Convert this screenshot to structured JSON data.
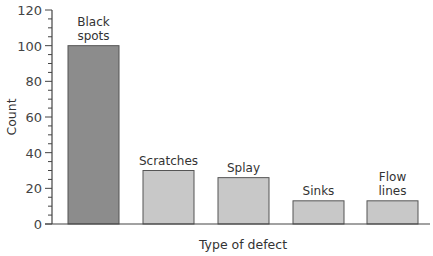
{
  "chart_data": {
    "type": "bar",
    "title": "",
    "xlabel": "Type of defect",
    "ylabel": "Count",
    "ylim": [
      0,
      120
    ],
    "yticks": [
      0,
      20,
      40,
      60,
      80,
      100,
      120
    ],
    "minor_tick_step": 5,
    "grid": false,
    "legend": null,
    "categories": [
      "Black spots",
      "Scratches",
      "Splay",
      "Sinks",
      "Flow lines"
    ],
    "category_label_lines": [
      [
        "Black",
        "spots"
      ],
      [
        "Scratches"
      ],
      [
        "Splay"
      ],
      [
        "Sinks"
      ],
      [
        "Flow",
        "lines"
      ]
    ],
    "values": [
      100,
      30,
      26,
      13,
      13
    ],
    "bar_colors": [
      "#8c8c8c",
      "#c8c8c8",
      "#c8c8c8",
      "#c8c8c8",
      "#c8c8c8"
    ],
    "bar_edge_color": "#555555"
  }
}
